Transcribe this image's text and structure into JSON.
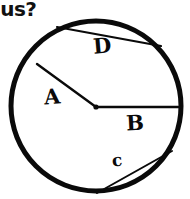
{
  "page": {
    "background_color": "#ffffff",
    "ink_color": "#0a0a0a",
    "width": 190,
    "height": 199
  },
  "question": {
    "visible_text": "dius?",
    "note": "partial text clipped at left edge"
  },
  "figure": {
    "type": "circle-diagram",
    "circle": {
      "center_x": 96,
      "center_y": 106,
      "radius": 85,
      "stroke_width": 5,
      "stroke_color": "#0a0a0a",
      "fill": "none"
    },
    "center_dot": {
      "x": 96,
      "y": 107,
      "radius": 2.6
    },
    "segments": [
      {
        "label": "A",
        "kind": "radius",
        "x1": 37,
        "y1": 64,
        "x2": 96,
        "y2": 107,
        "stroke_width": 2.4
      },
      {
        "label": "B",
        "kind": "radius",
        "x1": 96,
        "y1": 107,
        "x2": 181,
        "y2": 107,
        "stroke_width": 2.4
      },
      {
        "label": "c",
        "kind": "chord",
        "x1": 97,
        "y1": 193,
        "x2": 172,
        "y2": 151,
        "stroke_width": 2.0
      },
      {
        "label": "D",
        "kind": "chord",
        "x1": 57,
        "y1": 27,
        "x2": 161,
        "y2": 46,
        "stroke_width": 2.2
      }
    ]
  }
}
